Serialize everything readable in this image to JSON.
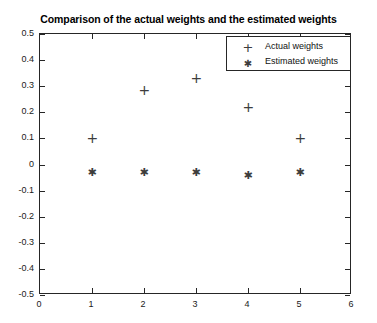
{
  "chart_data": {
    "type": "scatter",
    "title": "Comparison of the actual weights and the estimated weights",
    "xlabel": "",
    "ylabel": "",
    "xlim": [
      0,
      6
    ],
    "ylim": [
      -0.5,
      0.5
    ],
    "grid": false,
    "legend_position": "top-right",
    "x": [
      1,
      2,
      3,
      4,
      5
    ],
    "xticks": [
      "0",
      "1",
      "2",
      "3",
      "4",
      "5",
      "6"
    ],
    "xtick_values": [
      0,
      1,
      2,
      3,
      4,
      5,
      6
    ],
    "yticks": [
      "0.5",
      "0.4",
      "0.3",
      "0.2",
      "0.1",
      "0",
      "-0.1",
      "-0.2",
      "-0.3",
      "-0.4",
      "-0.5"
    ],
    "ytick_values": [
      0.5,
      0.4,
      0.3,
      0.2,
      0.1,
      0,
      -0.1,
      -0.2,
      -0.3,
      -0.4,
      -0.5
    ],
    "series": [
      {
        "name": "Actual weights",
        "marker": "plus",
        "color": "#3d3d3d",
        "values": [
          0.1,
          0.285,
          0.33,
          0.22,
          0.1
        ]
      },
      {
        "name": "Estimated weights",
        "marker": "asterisk",
        "color": "#3d3d3d",
        "values": [
          -0.025,
          -0.025,
          -0.025,
          -0.04,
          -0.025
        ]
      }
    ]
  },
  "legend": {
    "entries": [
      {
        "marker_icon": "plus-marker-icon",
        "label": "Actual weights"
      },
      {
        "marker_icon": "asterisk-marker-icon",
        "label": "Estimated weights"
      }
    ]
  }
}
